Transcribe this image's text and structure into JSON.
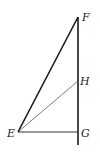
{
  "diagram": {
    "type": "geometric-figure",
    "points": {
      "F": {
        "label": "F",
        "x": 78,
        "y": 17
      },
      "H": {
        "label": "H",
        "x": 78,
        "y": 81
      },
      "G": {
        "label": "G",
        "x": 78,
        "y": 132
      },
      "E": {
        "label": "E",
        "x": 18,
        "y": 132
      }
    },
    "segments": [
      {
        "from": "E",
        "to": "F",
        "weight": "thick"
      },
      {
        "from": "F",
        "to": "G",
        "weight": "thick",
        "extends_below_to_y": 145
      },
      {
        "from": "E",
        "to": "H",
        "weight": "thin"
      },
      {
        "from": "E",
        "to": "G",
        "weight": "medium"
      }
    ],
    "colors": {
      "line": "#1a1a1a",
      "background": "#ffffff"
    }
  }
}
